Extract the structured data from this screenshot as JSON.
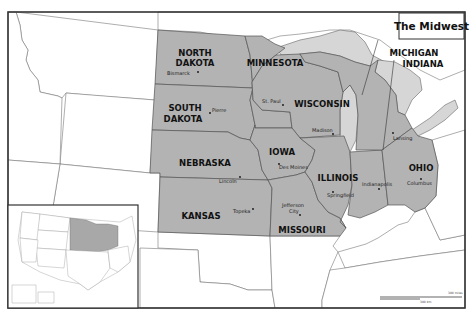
{
  "title": "The Midwest",
  "colors": {
    "midwest_fill": "#b3b3b3",
    "other_fill": "#ffffff",
    "lake_fill": "#d6d6d6",
    "border": "#555555"
  },
  "states": [
    {
      "name": "NORTH DAKOTA",
      "line1": "NORTH",
      "line2": "DAKOTA",
      "capital": "Bismarck"
    },
    {
      "name": "SOUTH DAKOTA",
      "line1": "SOUTH",
      "line2": "DAKOTA",
      "capital": "Pierre"
    },
    {
      "name": "MINNESOTA",
      "line1": "MINNESOTA",
      "capital": "St. Paul"
    },
    {
      "name": "WISCONSIN",
      "line1": "WISCONSIN",
      "capital": "Madison"
    },
    {
      "name": "NEBRASKA",
      "line1": "NEBRASKA",
      "capital": "Lincoln"
    },
    {
      "name": "IOWA",
      "line1": "IOWA",
      "capital": "Des Moines"
    },
    {
      "name": "ILLINOIS",
      "line1": "ILLINOIS",
      "capital": "Springfield"
    },
    {
      "name": "KANSAS",
      "line1": "KANSAS",
      "capital": "Topeka"
    },
    {
      "name": "MISSOURI",
      "line1": "MISSOURI",
      "capital": "Jefferson City",
      "cap_line1": "Jefferson",
      "cap_line2": "City"
    },
    {
      "name": "MICHIGAN",
      "line1": "MICHIGAN",
      "capital": "Lansing"
    },
    {
      "name": "INDIANA",
      "line1": "INDIANA",
      "capital": "Indianapolis"
    },
    {
      "name": "OHIO",
      "line1": "OHIO",
      "capital": "Columbus"
    }
  ],
  "inset": {
    "label": "United States locator map"
  },
  "scale_bar": {
    "label_top": "300 miles",
    "label_bottom": "300 km"
  }
}
